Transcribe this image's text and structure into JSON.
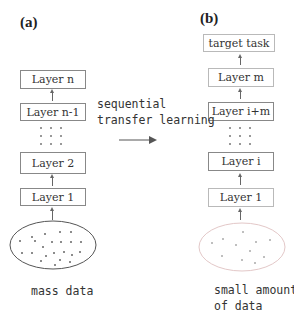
{
  "panels": {
    "a": {
      "label": "(a)",
      "layers": [
        "Layer n",
        "Layer n-1",
        "Layer 2",
        "Layer 1"
      ],
      "data_caption": "mass data"
    },
    "b": {
      "label": "(b)",
      "target": "target task",
      "layers": [
        "Layer m",
        "Layer i+m",
        "Layer i",
        "Layer 1"
      ],
      "data_caption_line1": "small amount",
      "data_caption_line2": "of data"
    }
  },
  "transition": {
    "line1": "sequential",
    "line2": "transfer learning"
  },
  "colors": {
    "box_border": "#888888",
    "left_ellipse": "#555555",
    "right_ellipse": "#e3c8c8",
    "dots": "#777777"
  }
}
